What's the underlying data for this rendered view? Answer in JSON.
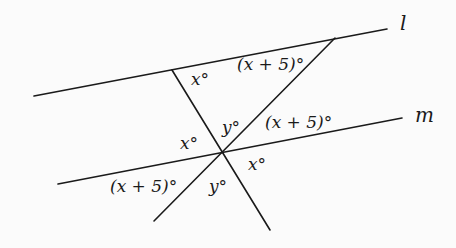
{
  "diagram": {
    "line_names": {
      "l": "l",
      "m": "m"
    },
    "lines": [
      {
        "name": "l",
        "x1": 34,
        "y1": 96,
        "x2": 387,
        "y2": 29
      },
      {
        "name": "m",
        "x1": 58,
        "y1": 184,
        "x2": 402,
        "y2": 118
      },
      {
        "name": "transversal-1",
        "x1": 172,
        "y1": 70,
        "x2": 270,
        "y2": 230
      },
      {
        "name": "transversal-2",
        "x1": 154,
        "y1": 221,
        "x2": 335,
        "y2": 38
      }
    ],
    "angle_labels": {
      "top_x": "x°",
      "top_x_plus_5": "(x + 5)°",
      "center_y_upper": "y°",
      "right_x_plus_5": "(x + 5)°",
      "left_x": "x°",
      "right_x_lower": "x°",
      "left_x_plus_5": "(x + 5)°",
      "bottom_y": "y°"
    },
    "colors": {
      "ink": "#1a1a1a",
      "background": "#fbfbfb"
    }
  }
}
